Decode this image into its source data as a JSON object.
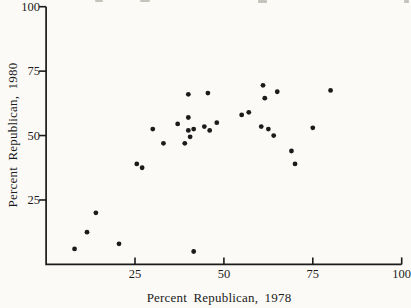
{
  "colors": {
    "ink": "#1b1b1b",
    "paper": "#fbfaf7"
  },
  "chart_data": {
    "type": "scatter",
    "title": "",
    "xlabel": "Percent Republican, 1978",
    "ylabel": "Percent Republican, 1980",
    "xlim": [
      0,
      100
    ],
    "ylim": [
      0,
      100
    ],
    "x_ticks": [
      25,
      50,
      75,
      100
    ],
    "y_ticks": [
      25,
      50,
      75,
      100
    ],
    "grid": false,
    "legend": false,
    "marker": "filled-circle",
    "points": [
      [
        8,
        6
      ],
      [
        11.5,
        12.5
      ],
      [
        14,
        20
      ],
      [
        20.5,
        8
      ],
      [
        25.5,
        39
      ],
      [
        27,
        37.5
      ],
      [
        30,
        52.5
      ],
      [
        33,
        47
      ],
      [
        37,
        54.5
      ],
      [
        39,
        47
      ],
      [
        40,
        66
      ],
      [
        40,
        57
      ],
      [
        40,
        52
      ],
      [
        40.5,
        49.5
      ],
      [
        41.5,
        52.5
      ],
      [
        41.5,
        5
      ],
      [
        44.5,
        53.5
      ],
      [
        45.5,
        66.5
      ],
      [
        46,
        52
      ],
      [
        48,
        55
      ],
      [
        55,
        58
      ],
      [
        57,
        59
      ],
      [
        60.5,
        53.5
      ],
      [
        61,
        69.5
      ],
      [
        61.5,
        64.5
      ],
      [
        62.5,
        52.5
      ],
      [
        64,
        50
      ],
      [
        65,
        67
      ],
      [
        69,
        44
      ],
      [
        70,
        39
      ],
      [
        75,
        53
      ],
      [
        80,
        67.5
      ]
    ]
  }
}
